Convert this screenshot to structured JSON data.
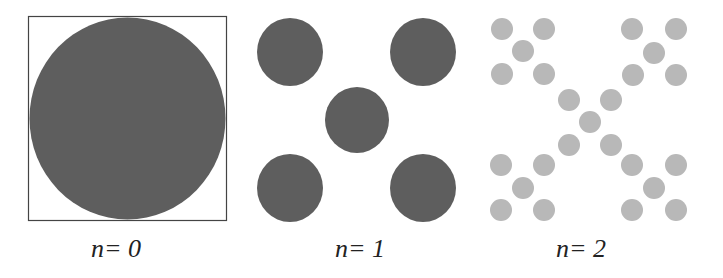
{
  "figure": {
    "colors": {
      "box_stroke": "#444444",
      "iteration_0_fill": "#5e5e5e",
      "iteration_1_fill": "#5e5e5e",
      "iteration_2_fill": "#b8b8b8",
      "label_text": "#222222"
    },
    "panels": [
      {
        "id": "n0",
        "label": "n= 0",
        "label_x": 91,
        "box": {
          "x": 28.5,
          "y": 16.5,
          "w": 198,
          "h": 204
        },
        "circles": [
          {
            "cx": 127.5,
            "cy": 118.5,
            "rx": 98,
            "ry": 101
          }
        ]
      },
      {
        "id": "n1",
        "label": "n= 1",
        "label_x": 335,
        "circles": [
          {
            "cx": 290,
            "cy": 52,
            "rx": 33,
            "ry": 34
          },
          {
            "cx": 423,
            "cy": 52,
            "rx": 33,
            "ry": 34
          },
          {
            "cx": 357,
            "cy": 120,
            "rx": 32,
            "ry": 33
          },
          {
            "cx": 290,
            "cy": 188,
            "rx": 33,
            "ry": 34
          },
          {
            "cx": 423,
            "cy": 188,
            "rx": 33,
            "ry": 34
          }
        ]
      },
      {
        "id": "n2",
        "label": "n= 2",
        "label_x": 556,
        "circles": [
          {
            "cx": 502,
            "cy": 29,
            "r": 11
          },
          {
            "cx": 544,
            "cy": 29,
            "r": 11
          },
          {
            "cx": 523,
            "cy": 51,
            "r": 11
          },
          {
            "cx": 502,
            "cy": 74,
            "r": 11
          },
          {
            "cx": 544,
            "cy": 74,
            "r": 11
          },
          {
            "cx": 632,
            "cy": 29,
            "r": 11
          },
          {
            "cx": 676,
            "cy": 29,
            "r": 11
          },
          {
            "cx": 654,
            "cy": 53,
            "r": 11
          },
          {
            "cx": 633,
            "cy": 75,
            "r": 11
          },
          {
            "cx": 676,
            "cy": 75,
            "r": 11
          },
          {
            "cx": 569,
            "cy": 100,
            "r": 11
          },
          {
            "cx": 611,
            "cy": 100,
            "r": 11
          },
          {
            "cx": 590,
            "cy": 122,
            "r": 11
          },
          {
            "cx": 569,
            "cy": 145,
            "r": 11
          },
          {
            "cx": 611,
            "cy": 145,
            "r": 11
          },
          {
            "cx": 501,
            "cy": 165,
            "r": 11
          },
          {
            "cx": 544,
            "cy": 165,
            "r": 11
          },
          {
            "cx": 523,
            "cy": 188,
            "r": 11
          },
          {
            "cx": 501,
            "cy": 210,
            "r": 11
          },
          {
            "cx": 544,
            "cy": 210,
            "r": 11
          },
          {
            "cx": 632,
            "cy": 165,
            "r": 11
          },
          {
            "cx": 676,
            "cy": 165,
            "r": 11
          },
          {
            "cx": 654,
            "cy": 188,
            "r": 11
          },
          {
            "cx": 632,
            "cy": 210,
            "r": 11
          },
          {
            "cx": 676,
            "cy": 210,
            "r": 11
          }
        ]
      }
    ]
  }
}
